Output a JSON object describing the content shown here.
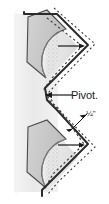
{
  "figure": {
    "name": "folding-pivot-detail-diagram",
    "labels": {
      "pivot": "Pivot.",
      "dimension": "¼\""
    },
    "colors": {
      "background": "#ffffff",
      "band_gray": "#eeeeee",
      "panel_gray": "#c9c9c9",
      "panel_gray_dark": "#b9b9b9",
      "fan_light": "#f0f0f0",
      "outline": "#2a2a2a",
      "dashed": "#3a3a3a",
      "leader": "#1a1a1a"
    },
    "elements": {
      "vertical_band": "light-gray-vertical-band",
      "upper_panel": "upper-diamond-panel",
      "lower_panel": "lower-diamond-panel",
      "upper_fan": "upper-arc-fan",
      "lower_fan": "lower-arc-fan",
      "zigzag_outline": "solid-zigzag-edge",
      "dashed_outline": "dashed-stitch-line",
      "pivot_leader": "pivot-leader-arrow",
      "dimension_leader": "dimension-leader-arrows"
    }
  }
}
